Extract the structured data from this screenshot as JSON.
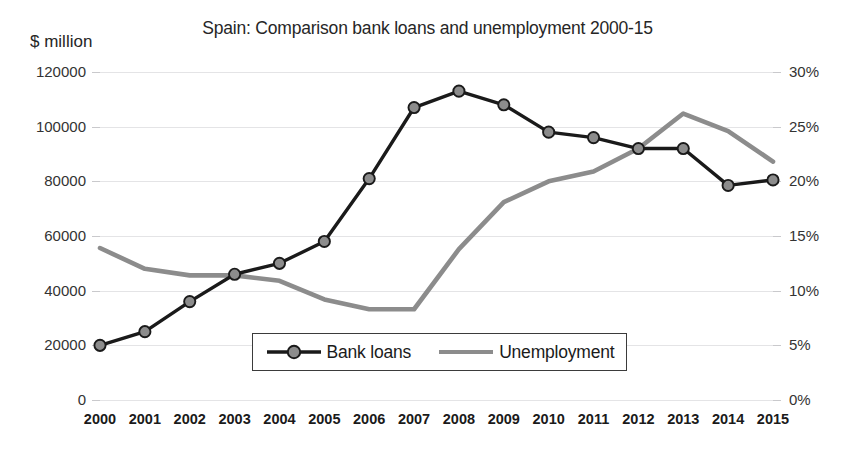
{
  "chart_data": {
    "type": "line",
    "title": "Spain: Comparison bank loans and unemployment 2000-15",
    "xlabel": "",
    "ylabel": "$ million",
    "y2label": "",
    "grid": true,
    "legend_position": "inside-bottom-center",
    "categories": [
      "2000",
      "2001",
      "2002",
      "2003",
      "2004",
      "2005",
      "2006",
      "2007",
      "2008",
      "2009",
      "2010",
      "2011",
      "2012",
      "2013",
      "2014",
      "2015"
    ],
    "ylim": [
      0,
      120000
    ],
    "yticks": [
      0,
      20000,
      40000,
      60000,
      80000,
      100000,
      120000
    ],
    "ytick_labels": [
      "0",
      "20000",
      "40000",
      "60000",
      "80000",
      "100000",
      "120000"
    ],
    "y2lim": [
      0,
      30
    ],
    "y2ticks": [
      0,
      5,
      10,
      15,
      20,
      25,
      30
    ],
    "y2tick_labels": [
      "0%",
      "5%",
      "10%",
      "15%",
      "20%",
      "25%",
      "30%"
    ],
    "series": [
      {
        "name": "Bank loans",
        "axis": "left",
        "color": "#1a1a1a",
        "marker": "circle",
        "marker_color": "#8c8c8c",
        "values": [
          20000,
          25000,
          36000,
          46000,
          50000,
          58000,
          81000,
          107000,
          113000,
          108000,
          98000,
          96000,
          92000,
          92000,
          78500,
          80500
        ]
      },
      {
        "name": "Unemployment",
        "axis": "right",
        "color": "#8c8c8c",
        "marker": "none",
        "values": [
          13.9,
          12.0,
          11.4,
          11.4,
          10.9,
          9.2,
          8.3,
          8.3,
          13.8,
          18.1,
          20.0,
          20.9,
          23.0,
          26.2,
          24.6,
          21.8
        ]
      }
    ]
  },
  "legend": {
    "entries": [
      {
        "label": "Bank loans"
      },
      {
        "label": "Unemployment"
      }
    ]
  }
}
